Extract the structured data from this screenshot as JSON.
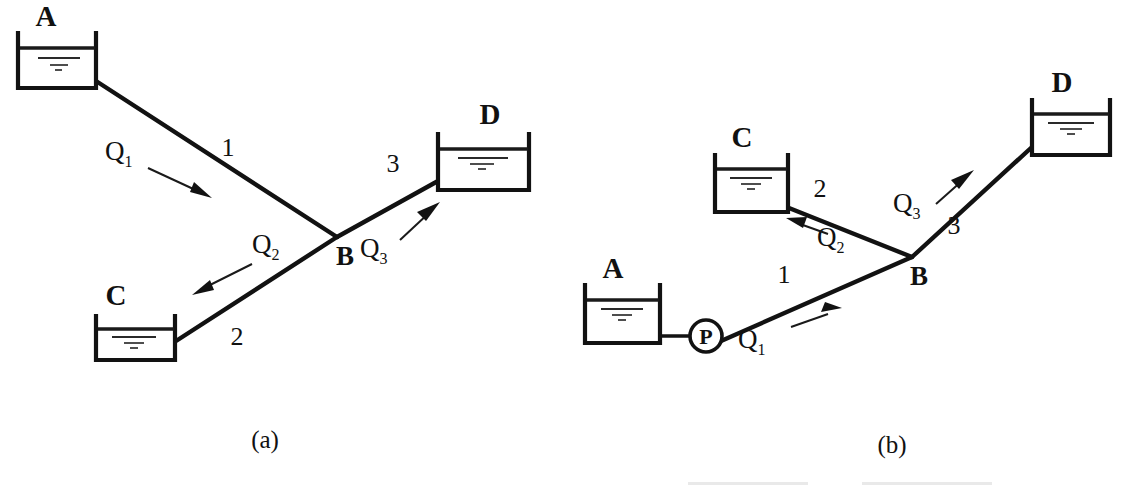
{
  "figure": {
    "background_color": "#ffffff",
    "ink_color": "#121212",
    "panels": [
      {
        "id": "panel-a",
        "caption": "(a)",
        "description": "Gravity-fed branching pipe system: reservoir A feeds junction B, which supplies reservoirs C and D",
        "reservoirs": [
          {
            "id": "A",
            "label": "A",
            "label_x": 46,
            "label_y": 26,
            "x": 18,
            "y": 33,
            "w": 78,
            "h": 55
          },
          {
            "id": "C",
            "label": "C",
            "label_x": 116,
            "label_y": 305,
            "x": 96,
            "y": 316,
            "w": 79,
            "h": 44
          },
          {
            "id": "D",
            "label": "D",
            "label_x": 490,
            "label_y": 124,
            "x": 438,
            "y": 134,
            "w": 91,
            "h": 56
          }
        ],
        "junction": {
          "id": "B",
          "label": "B",
          "x": 337,
          "y": 237,
          "label_x": 345,
          "label_y": 265
        },
        "pipes": [
          {
            "id": "pipe-1",
            "label": "1",
            "label_x": 228,
            "label_y": 156,
            "from": "A",
            "to": "B",
            "x1": 96,
            "y1": 81,
            "x2": 337,
            "y2": 237
          },
          {
            "id": "pipe-2",
            "label": "2",
            "label_x": 237,
            "label_y": 345,
            "from": "B",
            "to": "C",
            "x1": 337,
            "y1": 237,
            "x2": 176,
            "y2": 341
          },
          {
            "id": "pipe-3",
            "label": "3",
            "label_x": 393,
            "label_y": 172,
            "from": "B",
            "to": "D",
            "x1": 337,
            "y1": 237,
            "x2": 438,
            "y2": 181
          }
        ],
        "flows": [
          {
            "id": "Q1",
            "base": "Q",
            "sub": "1",
            "label_x": 118,
            "label_y": 160,
            "direction": "into-junction",
            "arrow": {
              "x1": 148,
              "y1": 168,
              "x2": 208,
              "y2": 196
            }
          },
          {
            "id": "Q2",
            "base": "Q",
            "sub": "2",
            "label_x": 264,
            "label_y": 253,
            "direction": "to-reservoir-C",
            "arrow": {
              "x1": 252,
              "y1": 264,
              "x2": 196,
              "y2": 293
            }
          },
          {
            "id": "Q3",
            "base": "Q",
            "sub": "3",
            "label_x": 370,
            "label_y": 257,
            "direction": "to-reservoir-D",
            "arrow": {
              "x1": 400,
              "y1": 240,
              "x2": 434,
              "y2": 208
            }
          }
        ],
        "pump": null
      },
      {
        "id": "panel-b",
        "caption": "(b)",
        "description": "Pumped branching pipe system: pump P lifts water from reservoir A to junction B, which supplies reservoirs C and D",
        "reservoirs": [
          {
            "id": "A",
            "label": "A",
            "label_x": 613,
            "label_y": 278,
            "x": 585,
            "y": 285,
            "w": 75,
            "h": 58
          },
          {
            "id": "C",
            "label": "C",
            "label_x": 742,
            "label_y": 147,
            "x": 715,
            "y": 155,
            "w": 73,
            "h": 57
          },
          {
            "id": "D",
            "label": "D",
            "label_x": 1062,
            "label_y": 92,
            "x": 1032,
            "y": 100,
            "w": 78,
            "h": 55
          }
        ],
        "junction": {
          "id": "B",
          "label": "B",
          "x": 912,
          "y": 257,
          "label_x": 919,
          "label_y": 285
        },
        "pipes": [
          {
            "id": "pipe-1",
            "label": "1",
            "label_x": 784,
            "label_y": 283,
            "from": "P",
            "to": "B",
            "x1": 722,
            "y1": 340,
            "x2": 912,
            "y2": 257
          },
          {
            "id": "pipe-2",
            "label": "2",
            "label_x": 820,
            "label_y": 197,
            "from": "B",
            "to": "C",
            "x1": 912,
            "y1": 257,
            "x2": 789,
            "y2": 208
          },
          {
            "id": "pipe-3",
            "label": "3",
            "label_x": 954,
            "label_y": 234,
            "from": "B",
            "to": "D",
            "x1": 912,
            "y1": 257,
            "x2": 1032,
            "y2": 147
          }
        ],
        "flows": [
          {
            "id": "Q1",
            "base": "Q",
            "sub": "1",
            "label_x": 751,
            "label_y": 348,
            "direction": "into-junction",
            "arrow": {
              "x1": 791,
              "y1": 327,
              "x2": 838,
              "y2": 310
            }
          },
          {
            "id": "Q2",
            "base": "Q",
            "sub": "2",
            "label_x": 829,
            "label_y": 246,
            "direction": "to-reservoir-C",
            "arrow": {
              "x1": 828,
              "y1": 234,
              "x2": 790,
              "y2": 220
            }
          },
          {
            "id": "Q3",
            "base": "Q",
            "sub": "3",
            "label_x": 903,
            "label_y": 212,
            "direction": "to-reservoir-D",
            "arrow": {
              "x1": 936,
              "y1": 204,
              "x2": 968,
              "y2": 176
            }
          }
        ],
        "pump": {
          "id": "P",
          "label": "P",
          "cx": 706,
          "cy": 336,
          "r": 16,
          "suction_pipe": {
            "x1": 660,
            "y1": 336,
            "x2": 690,
            "y2": 336
          }
        }
      }
    ],
    "captions": [
      {
        "id": "caption-a",
        "text": "(a)",
        "x": 265,
        "y": 448
      },
      {
        "id": "caption-b",
        "text": "(b)",
        "x": 892,
        "y": 453
      }
    ]
  }
}
